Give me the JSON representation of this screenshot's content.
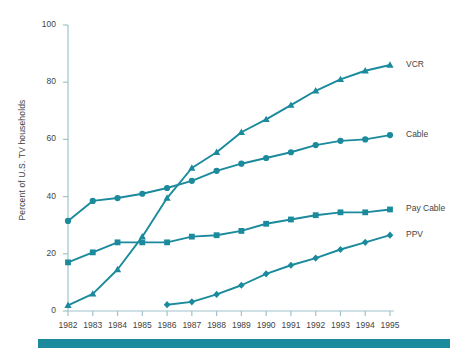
{
  "chart_data": {
    "type": "line",
    "title": "",
    "xlabel": "",
    "ylabel": "Percent of U.S. TV households",
    "categories": [
      "1982",
      "1983",
      "1984",
      "1985",
      "1986",
      "1987",
      "1988",
      "1989",
      "1990",
      "1991",
      "1992",
      "1993",
      "1994",
      "1995"
    ],
    "x": [
      1982,
      1983,
      1984,
      1985,
      1986,
      1987,
      1988,
      1989,
      1990,
      1991,
      1992,
      1993,
      1994,
      1995
    ],
    "ylim": [
      0,
      100
    ],
    "yticks": [
      0,
      20,
      40,
      60,
      80,
      100
    ],
    "grid": false,
    "legend_position": "right-inline",
    "series": [
      {
        "name": "VCR",
        "marker": "triangle",
        "color": "#1a8a9c",
        "x": [
          1982,
          1983,
          1984,
          1985,
          1986,
          1987,
          1988,
          1989,
          1990,
          1991,
          1992,
          1993,
          1994,
          1995
        ],
        "values": [
          2.0,
          6.0,
          14.5,
          26.0,
          39.5,
          50.0,
          55.5,
          62.5,
          67.0,
          72.0,
          77.0,
          81.0,
          84.0,
          86.0
        ]
      },
      {
        "name": "Cable",
        "marker": "circle",
        "color": "#1a8a9c",
        "x": [
          1982,
          1983,
          1984,
          1985,
          1986,
          1987,
          1988,
          1989,
          1990,
          1991,
          1992,
          1993,
          1994,
          1995
        ],
        "values": [
          31.5,
          38.5,
          39.5,
          41.0,
          43.0,
          45.5,
          49.0,
          51.5,
          53.5,
          55.5,
          58.0,
          59.5,
          60.0,
          61.5
        ]
      },
      {
        "name": "Pay Cable",
        "marker": "square",
        "color": "#1a8a9c",
        "x": [
          1982,
          1983,
          1984,
          1985,
          1986,
          1987,
          1988,
          1989,
          1990,
          1991,
          1992,
          1993,
          1994,
          1995
        ],
        "values": [
          17.0,
          20.5,
          24.0,
          24.0,
          24.0,
          26.0,
          26.5,
          28.0,
          30.5,
          32.0,
          33.5,
          34.5,
          34.5,
          35.5
        ]
      },
      {
        "name": "PPV",
        "marker": "diamond",
        "color": "#1a8a9c",
        "x": [
          1986,
          1987,
          1988,
          1989,
          1990,
          1991,
          1992,
          1993,
          1994,
          1995
        ],
        "values": [
          2.2,
          3.2,
          5.8,
          9.0,
          13.0,
          16.0,
          18.5,
          21.5,
          24.0,
          26.5
        ]
      }
    ],
    "legend_labels": [
      "VCR",
      "Cable",
      "Pay Cable",
      "PPV"
    ]
  },
  "colors": {
    "series": "#1a8a9c",
    "axis": "#9fc4cc",
    "text": "#444444",
    "accent_bar": "#1a8a9c",
    "background": "#ffffff"
  },
  "axes": {
    "y_title": "Percent of U.S. TV households",
    "y_tick_labels": [
      "100",
      "80",
      "60",
      "40",
      "20",
      "0"
    ],
    "x_tick_labels": [
      "1982",
      "1983",
      "1984",
      "1985",
      "1986",
      "1987",
      "1988",
      "1989",
      "1990",
      "1991",
      "1992",
      "1993",
      "1994",
      "1995"
    ]
  },
  "footer": {
    "accent_bar_present": "true"
  }
}
